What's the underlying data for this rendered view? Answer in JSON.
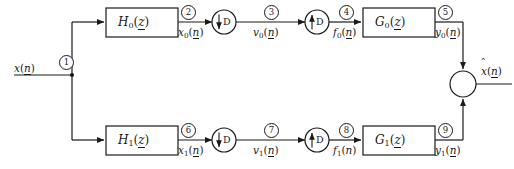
{
  "diagram": {
    "stroke_color": "#1a1a1a",
    "input": {
      "label_x": "x",
      "label_paren_open": "(",
      "label_n": "n",
      "label_paren_close": ")"
    },
    "output": {
      "label_x": "x",
      "label_paren_open": "(",
      "label_n": "n",
      "label_paren_close": ")"
    },
    "blocks": [
      {
        "name": "H",
        "sub": "0",
        "arg": "z"
      },
      {
        "name": "G",
        "sub": "0",
        "arg": "z"
      },
      {
        "name": "H",
        "sub": "1",
        "arg": "z"
      },
      {
        "name": "G",
        "sub": "1",
        "arg": "z"
      }
    ],
    "rate_changers": [
      {
        "kind": "downsampler",
        "arrow": "down",
        "factor": "D"
      },
      {
        "kind": "upsampler",
        "arrow": "up",
        "factor": "D"
      },
      {
        "kind": "downsampler",
        "arrow": "down",
        "factor": "D"
      },
      {
        "kind": "upsampler",
        "arrow": "up",
        "factor": "D"
      }
    ],
    "nodes": [
      {
        "id": "1",
        "glyph": "1"
      },
      {
        "id": "2",
        "glyph": "2"
      },
      {
        "id": "3",
        "glyph": "3"
      },
      {
        "id": "4",
        "glyph": "4"
      },
      {
        "id": "5",
        "glyph": "5"
      },
      {
        "id": "6",
        "glyph": "6"
      },
      {
        "id": "7",
        "glyph": "7"
      },
      {
        "id": "8",
        "glyph": "8"
      },
      {
        "id": "9",
        "glyph": "9"
      }
    ],
    "signals": [
      {
        "id": "x0",
        "base": "x",
        "sub": "0",
        "arg": "n"
      },
      {
        "id": "v0",
        "base": "v",
        "sub": "0",
        "arg": "n"
      },
      {
        "id": "f0",
        "base": "f",
        "sub": "0",
        "arg": "n"
      },
      {
        "id": "y0",
        "base": "y",
        "sub": "0",
        "arg": "n"
      },
      {
        "id": "x1",
        "base": "x",
        "sub": "1",
        "arg": "n"
      },
      {
        "id": "v1",
        "base": "v",
        "sub": "1",
        "arg": "n"
      },
      {
        "id": "f1",
        "base": "f",
        "sub": "1",
        "arg": "n"
      },
      {
        "id": "y1",
        "base": "y",
        "sub": "1",
        "arg": "n"
      }
    ],
    "adder": {
      "operation": "sum"
    }
  }
}
